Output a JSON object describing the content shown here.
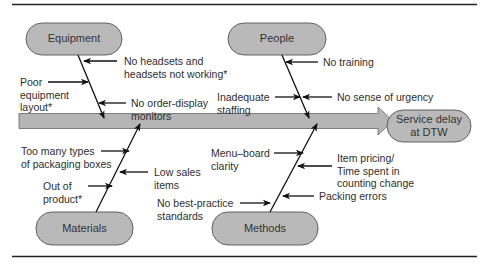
{
  "diagram": {
    "type": "fishbone",
    "effect": "Service delay\nat DTW",
    "categories": {
      "equipment": {
        "label": "Equipment",
        "causes": [
          "No headsets and\nheadsets not working*",
          "Poor\nequipment\nlayout*",
          "No order-display\nmonitors"
        ]
      },
      "people": {
        "label": "People",
        "causes": [
          "No training",
          "Inadequate\nstaffing",
          "No sense of urgency"
        ]
      },
      "materials": {
        "label": "Materials",
        "causes": [
          "Too many types\nof packaging boxes",
          "Low sales\nitems",
          "Out of\nproduct*"
        ]
      },
      "methods": {
        "label": "Methods",
        "causes": [
          "Menu–board\nclarity",
          "Item pricing/\nTime spent in\ncounting change",
          "No best-practice\nstandards",
          "Packing errors"
        ]
      }
    },
    "colors": {
      "pill_fill": "#b9b9b9",
      "pill_stroke": "#555555",
      "spine_fill": "#b5b5b5",
      "line": "#111111",
      "rule": "#222222"
    }
  }
}
